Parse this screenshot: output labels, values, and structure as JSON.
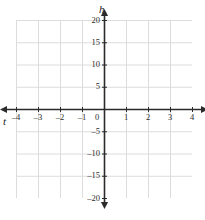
{
  "chart_data": {
    "type": "scatter",
    "title": "",
    "subtitle": "",
    "xlabel": "t",
    "ylabel": "h",
    "xlim": [
      -4,
      4
    ],
    "ylim": [
      -20,
      20
    ],
    "x_ticks": [
      -4,
      -3,
      -2,
      -1,
      0,
      1,
      2,
      3,
      4
    ],
    "x_tick_labels": [
      "–4",
      "–3",
      "–2",
      "–1",
      "0",
      "1",
      "2",
      "3",
      "4"
    ],
    "y_ticks": [
      20,
      15,
      10,
      5,
      0,
      -5,
      -10,
      -15,
      -20
    ],
    "y_tick_labels": [
      "20",
      "15",
      "10",
      "5",
      "0",
      "–5",
      "–10",
      "–15",
      "–20"
    ],
    "x_minor_step": 1,
    "y_minor_step": 5,
    "grid": true,
    "grid_color": "#dcdcdc",
    "axis_color": "#2b2b2b",
    "legend": [],
    "series": [],
    "annotations": []
  },
  "axes": {
    "horizontal": {
      "name": "t",
      "arrow_left": true,
      "arrow_right": true
    },
    "vertical": {
      "name": "h",
      "arrow_up": true,
      "arrow_down": true
    }
  },
  "origin": {
    "label": "0"
  }
}
